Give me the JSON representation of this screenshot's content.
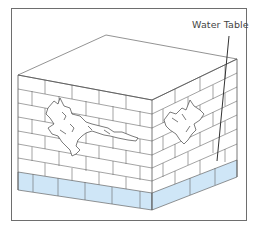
{
  "diagram": {
    "labels": {
      "water_table": "Water Table"
    },
    "colors": {
      "frame": "#6e6e6e",
      "lines": "#555555",
      "water": "#cfe6f7",
      "background": "#ffffff"
    },
    "elements": [
      "brick cube (top face, left face, right face)",
      "cracks on left face",
      "crack on right face",
      "blue water table band at base",
      "leader line to water table"
    ]
  }
}
